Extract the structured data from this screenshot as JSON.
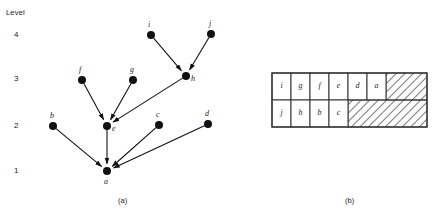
{
  "figure": {
    "axis_caption": "Level",
    "panel_a_caption": "(a)",
    "panel_b_caption": "(b)"
  },
  "levels": [
    {
      "label": "4",
      "y": 35
    },
    {
      "label": "3",
      "y": 79
    },
    {
      "label": "2",
      "y": 126
    },
    {
      "label": "1",
      "y": 171
    }
  ],
  "graph": {
    "node_radius": 4,
    "node_color": "#111111",
    "edge_color": "#111111",
    "nodes": [
      {
        "id": "i",
        "label": "i",
        "x": 151,
        "y": 35,
        "level": 4,
        "label_dx": -1,
        "label_dy": -9
      },
      {
        "id": "j",
        "label": "j",
        "x": 211,
        "y": 34,
        "level": 4,
        "label_dx": 0,
        "label_dy": -9
      },
      {
        "id": "f",
        "label": "f",
        "x": 82,
        "y": 80,
        "level": 3,
        "label_dx": -1,
        "label_dy": -9
      },
      {
        "id": "g",
        "label": "g",
        "x": 133,
        "y": 80,
        "level": 3,
        "label_dx": -1,
        "label_dy": -9
      },
      {
        "id": "h",
        "label": "h",
        "x": 186,
        "y": 76,
        "level": 3,
        "label_dx": 7,
        "label_dy": 4
      },
      {
        "id": "b",
        "label": "b",
        "x": 53,
        "y": 126,
        "level": 2,
        "label_dx": -1,
        "label_dy": -9
      },
      {
        "id": "e",
        "label": "e",
        "x": 107,
        "y": 126,
        "level": 2,
        "label_dx": 7,
        "label_dy": 4
      },
      {
        "id": "c",
        "label": "c",
        "x": 159,
        "y": 125,
        "level": 2,
        "label_dx": -1,
        "label_dy": -9
      },
      {
        "id": "d",
        "label": "d",
        "x": 208,
        "y": 124,
        "level": 2,
        "label_dx": -1,
        "label_dy": -9
      },
      {
        "id": "a",
        "label": "a",
        "x": 107,
        "y": 171,
        "level": 1,
        "label_dx": -1,
        "label_dy": 12
      }
    ],
    "edges": [
      {
        "from": "i",
        "to": "h"
      },
      {
        "from": "j",
        "to": "h"
      },
      {
        "from": "f",
        "to": "e"
      },
      {
        "from": "g",
        "to": "e"
      },
      {
        "from": "h",
        "to": "e"
      },
      {
        "from": "b",
        "to": "a"
      },
      {
        "from": "e",
        "to": "a"
      },
      {
        "from": "c",
        "to": "a"
      },
      {
        "from": "d",
        "to": "a"
      }
    ]
  },
  "chart_data": {
    "type": "diagram",
    "title": "",
    "subtitle": "",
    "xlabel": "",
    "ylabel": "Level",
    "levels": [
      4,
      3,
      2,
      1
    ],
    "nodes_by_level": {
      "4": [
        "i",
        "j"
      ],
      "3": [
        "f",
        "g",
        "h"
      ],
      "2": [
        "b",
        "e",
        "c",
        "d"
      ],
      "1": [
        "a"
      ]
    },
    "edges": [
      [
        "i",
        "h"
      ],
      [
        "j",
        "h"
      ],
      [
        "f",
        "e"
      ],
      [
        "g",
        "e"
      ],
      [
        "h",
        "e"
      ],
      [
        "b",
        "a"
      ],
      [
        "e",
        "a"
      ],
      [
        "c",
        "a"
      ],
      [
        "d",
        "a"
      ]
    ],
    "schedule_table": {
      "rows": [
        [
          "i",
          "g",
          "f",
          "e",
          "d",
          "a"
        ],
        [
          "j",
          "h",
          "b",
          "c"
        ]
      ],
      "columns": 8,
      "hatched_after_row": [
        6,
        4
      ]
    }
  },
  "table": {
    "origin_x": 32,
    "origin_y": 73,
    "cell_w": 19,
    "row_h": 27,
    "total_w": 155,
    "rows": [
      {
        "cells": [
          "i",
          "g",
          "f",
          "e",
          "d",
          "a"
        ]
      },
      {
        "cells": [
          "j",
          "h",
          "b",
          "c"
        ]
      }
    ],
    "colors": {
      "border": "#333333",
      "hatch": "#555555",
      "cell_bg": "#ffffff"
    }
  }
}
